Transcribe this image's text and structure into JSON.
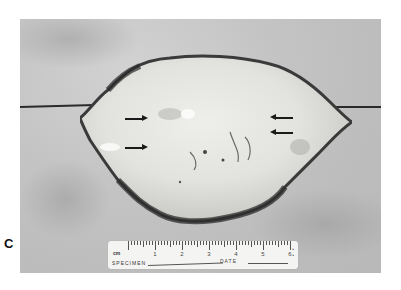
{
  "figure": {
    "panel_label": "C",
    "arrows": [
      {
        "side": "left",
        "direction": "right",
        "position": "upper"
      },
      {
        "side": "left",
        "direction": "right",
        "position": "lower"
      },
      {
        "side": "right",
        "direction": "left",
        "position": "upper"
      },
      {
        "side": "right",
        "direction": "left",
        "position": "lower"
      }
    ]
  },
  "ruler": {
    "unit": "cm",
    "numbers": [
      "1",
      "2",
      "3",
      "4",
      "5",
      "6"
    ],
    "specimen_label": "SPECIMEN",
    "date_label": "DATE"
  },
  "colors": {
    "background": "#ffffff",
    "photo_background": "#c4c4c4",
    "specimen_fill": "#e6e6e2",
    "specimen_edge": "#3a3a3a",
    "ruler": "#f4f4f2"
  }
}
